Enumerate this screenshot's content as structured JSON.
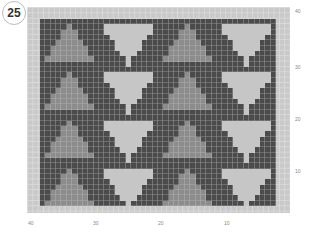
{
  "figure": {
    "number_badge": "25"
  },
  "colors": {
    "background_stitch": "#4b4b4b",
    "up_triangle": "#8c8c8c",
    "down_triangle": "#c6c6c6",
    "border": "#c9c9c9"
  },
  "grid": {
    "columns": 44,
    "rows": 35,
    "blocks_across": 4,
    "blocks_down": 4
  },
  "axis_labels": {
    "right": [
      {
        "text": "40",
        "top": 8
      },
      {
        "text": "30",
        "top": 64
      },
      {
        "text": "20",
        "top": 116
      },
      {
        "text": "10",
        "top": 168
      }
    ],
    "bottom": [
      {
        "text": "40",
        "left": 28
      },
      {
        "text": "30",
        "left": 93
      },
      {
        "text": "20",
        "left": 158
      },
      {
        "text": "10",
        "left": 224
      }
    ]
  },
  "motif": {
    "up_triangle_rows": [
      "00000000000",
      "00000100000",
      "00001110000",
      "00001110000",
      "00011111000",
      "00111111100",
      "00111111100",
      "01111111110",
      "00000000000"
    ],
    "down_triangle_rows": [
      "00000000000",
      "01111111110",
      "01111111110",
      "00111111100",
      "00011111000",
      "00011111000",
      "00001110000",
      "00000100000",
      "00000100000"
    ]
  }
}
